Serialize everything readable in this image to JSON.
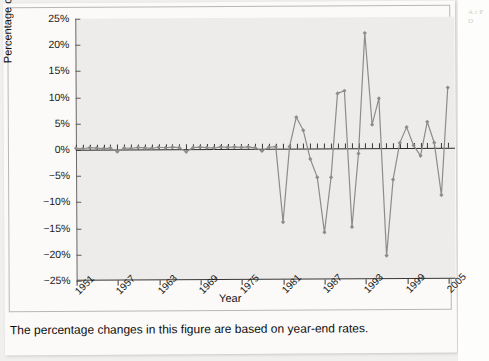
{
  "figure": {
    "caption": "The percentage changes in this figure are based on year-end rates.",
    "edge_note": "A c P D"
  },
  "chart_data": {
    "type": "line",
    "title": "",
    "xlabel": "Year",
    "ylabel": "Percentage change",
    "xlim": [
      1951,
      2006
    ],
    "ylim": [
      -25,
      25
    ],
    "ytick_labels": [
      "25%",
      "20%",
      "15%",
      "10%",
      "5%",
      "0%",
      "−5%",
      "−10%",
      "−15%",
      "−20%",
      "−25%"
    ],
    "ytick_values": [
      25,
      20,
      15,
      10,
      5,
      0,
      -5,
      -10,
      -15,
      -20,
      -25
    ],
    "xtick_labels": [
      "1951",
      "1957",
      "1963",
      "1969",
      "1975",
      "1981",
      "1987",
      "1993",
      "1999",
      "2005"
    ],
    "xtick_values": [
      1951,
      1957,
      1963,
      1969,
      1975,
      1981,
      1987,
      1993,
      1999,
      2005
    ],
    "grid": false,
    "legend": false,
    "marker": "diamond",
    "line_color": "#8c8c8c",
    "series": [
      {
        "name": "Percentage change",
        "x": [
          1951,
          1952,
          1953,
          1954,
          1955,
          1956,
          1957,
          1958,
          1959,
          1960,
          1961,
          1962,
          1963,
          1964,
          1965,
          1966,
          1967,
          1968,
          1969,
          1970,
          1971,
          1972,
          1973,
          1974,
          1975,
          1976,
          1977,
          1978,
          1979,
          1980,
          1981,
          1982,
          1983,
          1984,
          1985,
          1986,
          1987,
          1988,
          1989,
          1990,
          1991,
          1992,
          1993,
          1994,
          1995,
          1996,
          1997,
          1998,
          1999,
          2000,
          2001,
          2002,
          2003,
          2004,
          2005
        ],
        "values": [
          0.3,
          0.2,
          0.4,
          0.3,
          0.2,
          0.3,
          -0.4,
          0.3,
          0.2,
          0.4,
          0.3,
          0.2,
          0.4,
          0.3,
          0.4,
          0.3,
          -0.5,
          0.3,
          0.4,
          0.3,
          0.2,
          0.4,
          0.3,
          0.4,
          0.3,
          0.4,
          0.2,
          -0.4,
          0.3,
          0.4,
          -14.0,
          0.4,
          6.0,
          3.5,
          -2.0,
          -5.5,
          -16.0,
          -5.5,
          10.5,
          11.0,
          -15.0,
          -1.0,
          22.0,
          4.5,
          9.5,
          -20.5,
          -6.0,
          1.0,
          4.0,
          0.5,
          -1.5,
          5.0,
          1.0,
          -9.0,
          11.5
        ]
      }
    ],
    "annotations": []
  }
}
